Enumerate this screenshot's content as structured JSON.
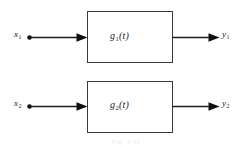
{
  "figure": {
    "caption": "Fig. 3-11",
    "paths": [
      {
        "input_label": "x",
        "input_sub": "1",
        "block_label": "g",
        "block_sub": "1",
        "block_arg": "(t)",
        "output_label": "y",
        "output_sub": "1"
      },
      {
        "input_label": "x",
        "input_sub": "2",
        "block_label": "g",
        "block_sub": "2",
        "block_arg": "(t)",
        "output_label": "y",
        "output_sub": "2"
      }
    ],
    "colors": {
      "line": "#1a1a1a",
      "box_stroke": "#3a3a3a",
      "background": "#ffffff",
      "caption": "#e9e9e9"
    }
  }
}
